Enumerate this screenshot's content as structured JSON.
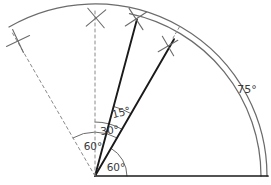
{
  "figure": {
    "kind": "geometric-angle-construction",
    "background_color": "#ffffff",
    "line_color_solid": "#1a1a1a",
    "line_color_arc": "#6b6b6b",
    "line_color_dashed": "#8a8a8a",
    "label_color": "#3a3a3a"
  },
  "vertex": {
    "x": 95,
    "y": 176
  },
  "labels": [
    {
      "id": "angle-15",
      "text": "15°",
      "x": 122,
      "y": 116,
      "rotate": -14,
      "size": "small"
    },
    {
      "id": "angle-30",
      "text": "30°",
      "x": 110,
      "y": 134,
      "rotate": -6,
      "size": "small"
    },
    {
      "id": "angle-60a",
      "text": "60°",
      "x": 93,
      "y": 150,
      "rotate": 0,
      "size": "small"
    },
    {
      "id": "angle-60b",
      "text": "60°",
      "x": 116,
      "y": 171,
      "rotate": 0,
      "size": "small"
    },
    {
      "id": "angle-75",
      "text": "75°",
      "x": 247,
      "y": 93,
      "rotate": 0,
      "size": "large"
    }
  ],
  "rays": [
    {
      "id": "baseline",
      "angle_deg": 0,
      "length": 173,
      "style": "solid",
      "weight": 1.7
    },
    {
      "id": "ray-60",
      "angle_deg": 60,
      "length": 158,
      "style": "solid",
      "weight": 1.9
    },
    {
      "id": "ray-75",
      "angle_deg": 75,
      "length": 162,
      "style": "solid",
      "weight": 1.9
    },
    {
      "id": "ray-90",
      "angle_deg": 90,
      "length": 166,
      "style": "dashed",
      "weight": 1.0
    },
    {
      "id": "ray-120",
      "angle_deg": 120,
      "length": 166,
      "style": "dashed",
      "weight": 1.0
    }
  ],
  "arcs": [
    {
      "id": "outer-arc-main",
      "radius": 172,
      "from_deg": 0,
      "to_deg": 120,
      "style": "solid"
    },
    {
      "id": "outer-arc-inner",
      "radius": 166,
      "from_deg": 0,
      "to_deg": 78,
      "style": "solid"
    },
    {
      "id": "arc-60-dashed",
      "radius": 44,
      "from_deg": 60,
      "to_deg": 120,
      "style": "solid"
    },
    {
      "id": "arc-30",
      "radius": 54,
      "from_deg": 60,
      "to_deg": 90,
      "style": "solid"
    },
    {
      "id": "arc-15",
      "radius": 72,
      "from_deg": 60,
      "to_deg": 75,
      "style": "solid"
    },
    {
      "id": "arc-60-base",
      "radius": 32,
      "from_deg": 0,
      "to_deg": 60,
      "style": "solid"
    }
  ],
  "cross_marks": [
    {
      "id": "cross-left",
      "x": 18,
      "y": 41,
      "r": 9,
      "rotate": 20
    },
    {
      "id": "cross-top-center",
      "x": 96,
      "y": 18,
      "r": 9,
      "rotate": 5
    },
    {
      "id": "cross-top-right",
      "x": 136,
      "y": 19,
      "r": 9,
      "rotate": 12
    },
    {
      "id": "cross-arc-right",
      "x": 168,
      "y": 46,
      "r": 8,
      "rotate": 15
    }
  ],
  "tick_marks": [
    {
      "id": "tick-dashed-up-right",
      "x1": 173,
      "y1": 38,
      "x2": 180,
      "y2": 26
    }
  ]
}
